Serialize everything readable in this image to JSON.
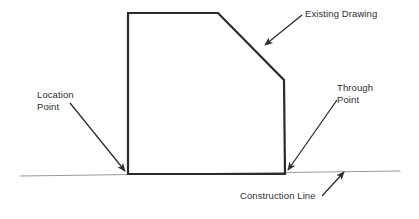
{
  "diagram": {
    "colors": {
      "shape_stroke": "#2b2b2b",
      "construction_line": "#9a9a9a",
      "leader_stroke": "#2e2e2e",
      "text": "#2e2e2e",
      "background": "#ffffff"
    },
    "shape": {
      "name": "existing-drawing-outline",
      "points": "128,13 218,13 284,80 285,174 128,174",
      "stroke_width": 2.2
    },
    "construction_line": {
      "name": "construction-line",
      "x1": 20,
      "y1": 176,
      "x2": 400,
      "y2": 171,
      "stroke_width": 1.1
    },
    "labels": {
      "existing_drawing": "Existing Drawing",
      "location_point_line1": "Location",
      "location_point_line2": "Point",
      "through_point_line1": "Through",
      "through_point_line2": "Point",
      "construction_line": "Construction Line"
    },
    "leaders": [
      {
        "name": "leader-existing-drawing",
        "x1": 302,
        "y1": 15,
        "x2": 265,
        "y2": 45,
        "target": "chamfer-edge"
      },
      {
        "name": "leader-location-point",
        "x1": 70,
        "y1": 103,
        "x2": 125,
        "y2": 171,
        "target": "bottom-left-corner"
      },
      {
        "name": "leader-through-point",
        "x1": 337,
        "y1": 100,
        "x2": 288,
        "y2": 170,
        "target": "bottom-right-corner"
      },
      {
        "name": "leader-construction-line",
        "x1": 322,
        "y1": 196,
        "x2": 344,
        "y2": 172,
        "target": "construction-line"
      }
    ],
    "points_of_interest": [
      {
        "name": "location-point",
        "x": 128,
        "y": 174
      },
      {
        "name": "through-point",
        "x": 285,
        "y": 174
      }
    ]
  }
}
